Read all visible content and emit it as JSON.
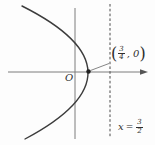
{
  "figure": {
    "type": "math-diagram",
    "origin_label": "O",
    "point_label": {
      "open_paren": "(",
      "numerator": "3",
      "denominator": "4",
      "comma_zero": ", 0",
      "close_paren": ")"
    },
    "directrix_label": {
      "variable": "x",
      "equals": "=",
      "numerator": "3",
      "denominator": "2"
    },
    "colors": {
      "axis": "#7d7d7d",
      "curve": "#3c3c3c",
      "dashed_line": "#4a4a4a",
      "arrow": "#555555",
      "dot": "#222222",
      "leader": "#666666",
      "text": "#2e2e2e",
      "background": "#fdfdfd"
    }
  }
}
